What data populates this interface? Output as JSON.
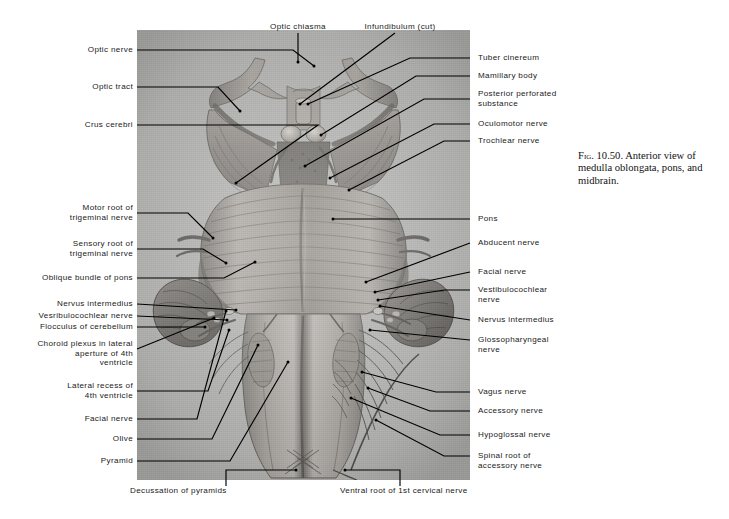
{
  "figure": {
    "caption_prefix": "Fig. 10.50.",
    "caption_text": "Anterior view of medulla oblongata, pons, and midbrain.",
    "plate_kind": "anatomical-photograph",
    "plate_subject": "anterior view of brainstem: midbrain, pons and medulla oblongata"
  },
  "colors": {
    "page_background": "#ffffff",
    "plate_background": "#c3c3c1",
    "leader_line": "#000000",
    "label_text": "#1a1a1a"
  },
  "labels": {
    "top": [
      {
        "id": "optic-chiasma",
        "text": "Optic chiasma"
      },
      {
        "id": "infundibulum-cut",
        "text": "Infundibulum (cut)"
      }
    ],
    "left": [
      {
        "id": "optic-nerve",
        "text": "Optic nerve"
      },
      {
        "id": "optic-tract",
        "text": "Optic tract"
      },
      {
        "id": "crus-cerebri",
        "text": "Crus cerebri"
      },
      {
        "id": "motor-root-trigeminal",
        "text": "Motor root of\ntrigeminal nerve"
      },
      {
        "id": "sensory-root-trigeminal",
        "text": "Sensory root of\ntrigeminal nerve"
      },
      {
        "id": "oblique-bundle-pons",
        "text": "Oblique bundle of pons"
      },
      {
        "id": "nervus-intermedius-left",
        "text": "Nervus intermedius"
      },
      {
        "id": "vestibulocochlear-left",
        "text": "Vesribulocochlear nerve"
      },
      {
        "id": "flocculus-cerebellum",
        "text": "Flocculus of cerebellum"
      },
      {
        "id": "choroid-plexus-lateral-aperture",
        "text": "Choroid plexus in lateral\naperture of 4th\nventricle"
      },
      {
        "id": "lateral-recess-4th-ventricle",
        "text": "Lateral recess of\n4th ventricle"
      },
      {
        "id": "facial-nerve-left",
        "text": "Facial nerve"
      },
      {
        "id": "olive",
        "text": "Olive"
      },
      {
        "id": "pyramid",
        "text": "Pyramid"
      }
    ],
    "right": [
      {
        "id": "tuber-cinereum",
        "text": "Tuber cinereum"
      },
      {
        "id": "mamillary-body",
        "text": "Mamillary body"
      },
      {
        "id": "posterior-perforated-substance",
        "text": "Posterior perforated\nsubstance"
      },
      {
        "id": "oculomotor-nerve",
        "text": "Oculomotor nerve"
      },
      {
        "id": "trochlear-nerve",
        "text": "Trochlear nerve"
      },
      {
        "id": "pons",
        "text": "Pons"
      },
      {
        "id": "abducent-nerve",
        "text": "Abducent nerve"
      },
      {
        "id": "facial-nerve-right",
        "text": "Facial nerve"
      },
      {
        "id": "vestibulocochlear-right",
        "text": "Vestibulocochlear\nnerve"
      },
      {
        "id": "nervus-intermedius-right",
        "text": "Nervus intermedius"
      },
      {
        "id": "glossopharyngeal-nerve",
        "text": "Glossopharyngeal\nnerve"
      },
      {
        "id": "vagus-nerve",
        "text": "Vagus nerve"
      },
      {
        "id": "accessory-nerve",
        "text": "Accessory nerve"
      },
      {
        "id": "hypoglossal-nerve",
        "text": "Hypoglossal nerve"
      },
      {
        "id": "spinal-root-accessory",
        "text": "Spinal root of\naccessory nerve"
      }
    ],
    "bottom": [
      {
        "id": "decussation-of-pyramids",
        "text": "Decussation of pyramids"
      },
      {
        "id": "ventral-root-1st-cervical",
        "text": "Ventral root of 1st cervical nerve"
      }
    ]
  }
}
